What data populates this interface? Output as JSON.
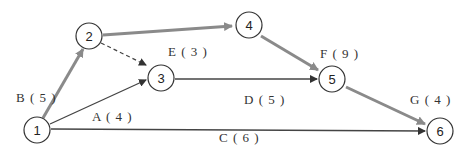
{
  "diagram": {
    "type": "activity-on-arrow network",
    "nodes": [
      {
        "id": "1",
        "label": "1",
        "x": 37,
        "y": 130
      },
      {
        "id": "2",
        "label": "2",
        "x": 89,
        "y": 36
      },
      {
        "id": "3",
        "label": "3",
        "x": 160,
        "y": 78
      },
      {
        "id": "4",
        "label": "4",
        "x": 249,
        "y": 25
      },
      {
        "id": "5",
        "label": "5",
        "x": 332,
        "y": 79
      },
      {
        "id": "6",
        "label": "6",
        "x": 440,
        "y": 131
      }
    ],
    "edges": [
      {
        "from": "1",
        "to": "2",
        "activity": "B",
        "duration": 5,
        "label": "B ( 5 )",
        "style": "critical"
      },
      {
        "from": "1",
        "to": "3",
        "activity": "A",
        "duration": 4,
        "label": "A ( 4 )",
        "style": "normal"
      },
      {
        "from": "1",
        "to": "6",
        "activity": "C",
        "duration": 6,
        "label": "C ( 6 )",
        "style": "normal"
      },
      {
        "from": "2",
        "to": "3",
        "activity": "E",
        "duration": 3,
        "label": "E ( 3 )",
        "style": "dashed"
      },
      {
        "from": "2",
        "to": "4",
        "activity": "",
        "duration": null,
        "label": "",
        "style": "critical"
      },
      {
        "from": "3",
        "to": "5",
        "activity": "D",
        "duration": 5,
        "label": "D ( 5 )",
        "style": "normal"
      },
      {
        "from": "4",
        "to": "5",
        "activity": "F",
        "duration": 9,
        "label": "F ( 9 )",
        "style": "critical"
      },
      {
        "from": "5",
        "to": "6",
        "activity": "G",
        "duration": 4,
        "label": "G ( 4 )",
        "style": "critical"
      }
    ],
    "colors": {
      "critical": "#8a8a8a",
      "normal": "#444444",
      "node_stroke": "#333333"
    }
  }
}
